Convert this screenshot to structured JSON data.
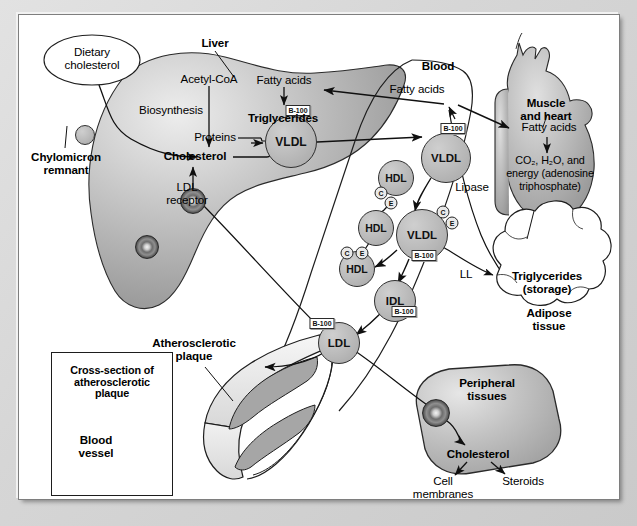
{
  "diagram": {
    "domain": "Diagram"
  },
  "colors": {
    "page_background": "#cfcfcf",
    "panel_background": "#ffffff",
    "organ_fill": "#b4b4b4",
    "lipoprotein_fill": "#bdbdbd",
    "plaque_fill": "#a8a8a8",
    "stroke": "#1d1d1d"
  },
  "regions": {
    "liver": {
      "label": "Liver"
    },
    "blood": {
      "label": "Blood"
    },
    "muscle_heart": {
      "label": "Muscle\nand heart"
    },
    "adipose": {
      "label": "Adipose\ntissue"
    },
    "peripheral": {
      "label": "Peripheral\ntissues"
    }
  },
  "labels": {
    "dietary_cholesterol": "Dietary\ncholesterol",
    "chylomicron_remnant": "Chylomicron\nremnant",
    "acetyl_coa": "Acetyl-CoA",
    "biosynthesis": "Biosynthesis",
    "cholesterol_liver": "Cholesterol",
    "fatty_acids_liver": "Fatty acids",
    "triglycerides_liver": "Triglycerides",
    "proteins": "Proteins",
    "ldl_receptor": "LDL\nreceptor",
    "liver": "Liver",
    "blood": "Blood",
    "fatty_acids_blood": "Fatty acids",
    "lipase": "Lipase",
    "ll": "LL",
    "muscle_and_heart": "Muscle\nand heart",
    "fatty_acids_muscle": "Fatty acids",
    "energy_products_line1": "CO₂, H₂O, and",
    "energy_products_line2": "energy (adenosine",
    "energy_products_line3": "triphosphate)",
    "triglycerides_storage": "Triglycerides\n(storage)",
    "adipose_tissue": "Adipose\ntissue",
    "atherosclerotic_plaque": "Atherosclerotic\nplaque",
    "peripheral_tissues": "Peripheral\ntissues",
    "cholesterol_peripheral": "Cholesterol",
    "cell_membranes": "Cell\nmembranes",
    "steroids": "Steroids"
  },
  "inset": {
    "title": "Cross-section of\natherosclerotic\nplaque",
    "vessel_label": "Blood\nvessel"
  },
  "lipoproteins": [
    {
      "id": "vldl-liver",
      "name": "VLDL",
      "tag": "B-100",
      "cx": 272,
      "cy": 127,
      "r": 25
    },
    {
      "id": "vldl-blood",
      "name": "VLDL",
      "tag": "B-100",
      "cx": 427,
      "cy": 143,
      "r": 24
    },
    {
      "id": "hdl-1",
      "name": "HDL",
      "tag": "",
      "cx": 377,
      "cy": 163,
      "r": 17
    },
    {
      "id": "vldl-remnant",
      "name": "VLDL",
      "tag": "B-100",
      "cx": 403,
      "cy": 220,
      "r": 25
    },
    {
      "id": "hdl-2",
      "name": "HDL",
      "tag": "",
      "cx": 357,
      "cy": 213,
      "r": 17
    },
    {
      "id": "hdl-3",
      "name": "HDL",
      "tag": "",
      "cx": 338,
      "cy": 254,
      "r": 17
    },
    {
      "id": "idl",
      "name": "IDL",
      "tag": "B-100",
      "cx": 376,
      "cy": 286,
      "r": 20
    },
    {
      "id": "ldl",
      "name": "LDL",
      "tag": "B-100",
      "cx": 320,
      "cy": 328,
      "r": 20
    },
    {
      "id": "chylomicron-remnant",
      "name": "",
      "tag": "",
      "cx": 66,
      "cy": 120,
      "r": 9
    }
  ],
  "apo_markers": [
    {
      "letter": "C",
      "cx": 362,
      "cy": 178
    },
    {
      "letter": "E",
      "cx": 372,
      "cy": 188
    },
    {
      "letter": "C",
      "cx": 424,
      "cy": 197
    },
    {
      "letter": "E",
      "cx": 433,
      "cy": 208
    },
    {
      "letter": "C",
      "cx": 328,
      "cy": 238
    },
    {
      "letter": "E",
      "cx": 343,
      "cy": 238
    }
  ],
  "tags": [
    {
      "text": "B-100",
      "x": 279,
      "y": 95
    },
    {
      "text": "B-100",
      "x": 434,
      "y": 113
    },
    {
      "text": "B-100",
      "x": 405,
      "y": 240
    },
    {
      "text": "B-100",
      "x": 385,
      "y": 296
    },
    {
      "text": "B-100",
      "x": 303,
      "y": 308
    }
  ]
}
